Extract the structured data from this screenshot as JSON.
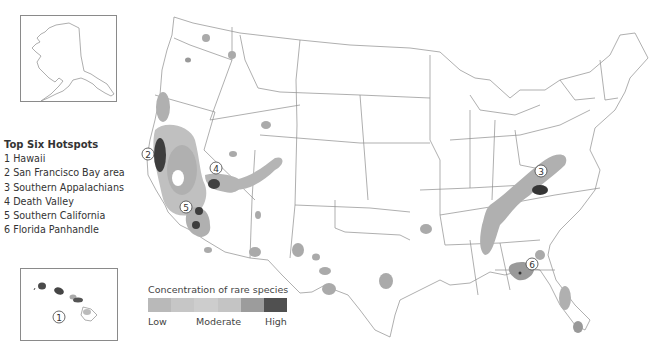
{
  "map": {
    "subject": "Rare species concentration hotspots, United States",
    "insets": [
      "Alaska",
      "Hawaii"
    ]
  },
  "hotspots": {
    "title": "Top Six Hotspots",
    "items": [
      {
        "number": "1",
        "label": "1 Hawaii"
      },
      {
        "number": "2",
        "label": "2 San Francisco Bay area"
      },
      {
        "number": "3",
        "label": "3 Southern Appalachians"
      },
      {
        "number": "4",
        "label": "4 Death Valley"
      },
      {
        "number": "5",
        "label": "5 Southern California"
      },
      {
        "number": "6",
        "label": "6 Florida Panhandle"
      }
    ]
  },
  "legend": {
    "title": "Concentration of rare species",
    "low": "Low",
    "moderate": "Moderate",
    "high": "High",
    "colors": [
      "#b9b9b9",
      "#c6c6c6",
      "#cdcdcd",
      "#c4c4c4",
      "#9c9c9c",
      "#505050"
    ]
  },
  "markers": {
    "m1": "1",
    "m2": "2",
    "m3": "3",
    "m4": "4",
    "m5": "5",
    "m6": "6"
  },
  "colors": {
    "border": "#8a8a8a",
    "low": "#b5b5b5",
    "mid": "#999999",
    "high": "#3f3f3f"
  }
}
